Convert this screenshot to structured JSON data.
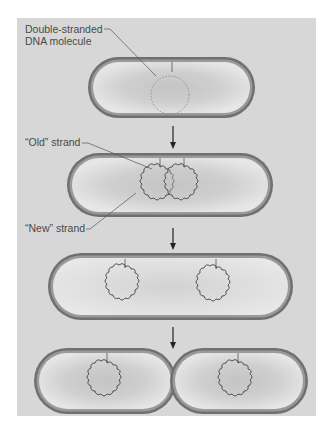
{
  "figure": {
    "background_color": "#d7d7d7",
    "cell_wall_color": "#6e6e6e",
    "cytoplasm_color": "#e4e4e4",
    "dna_color": "#4a4a4a",
    "labels": {
      "dna_molecule_line1": "Double-stranded",
      "dna_molecule_line2": "DNA molecule",
      "old_strand": "“Old” strand",
      "new_strand": "“New” strand"
    },
    "stages": [
      {
        "name": "cell-with-single-dna",
        "arrow_after": true
      },
      {
        "name": "cell-replicating-dna",
        "arrow_after": true
      },
      {
        "name": "cell-elongated-two-chromosomes",
        "arrow_after": true
      },
      {
        "name": "cell-dividing-binary-fission",
        "arrow_after": false
      }
    ],
    "arrow_icon": "down-arrow-icon"
  }
}
